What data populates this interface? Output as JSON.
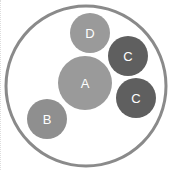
{
  "diagram": {
    "container": {
      "cx": 86,
      "cy": 86,
      "r": 80,
      "stroke": "#8a8a8a",
      "stroke_width": 3
    },
    "circles": [
      {
        "label": "A",
        "cx": 85,
        "cy": 83,
        "r": 27,
        "fill": "#9a9a9a"
      },
      {
        "label": "D",
        "cx": 90,
        "cy": 33,
        "r": 20,
        "fill": "#9a9a9a"
      },
      {
        "label": "C",
        "cx": 128,
        "cy": 56,
        "r": 20,
        "fill": "#5f5f5f"
      },
      {
        "label": "C",
        "cx": 136,
        "cy": 98,
        "r": 20,
        "fill": "#5f5f5f"
      },
      {
        "label": "B",
        "cx": 47,
        "cy": 119,
        "r": 20,
        "fill": "#8f8f8f"
      }
    ]
  }
}
